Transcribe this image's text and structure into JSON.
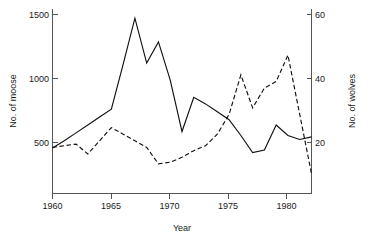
{
  "chart_data": {
    "type": "line",
    "title": "",
    "subtitle": "",
    "xlabel": "Year",
    "ylabel": "No. of moose",
    "y2label": "No. of wolves",
    "xlim": [
      1960,
      1982
    ],
    "ylim": [
      200,
      1600
    ],
    "y2lim": [
      8,
      64
    ],
    "grid": false,
    "legend": "none",
    "x_ticks": [
      1960,
      1965,
      1970,
      1975,
      1980
    ],
    "x_tick_labels": [
      "1960",
      "1965",
      "1970",
      "1975",
      "1980"
    ],
    "y_ticks": [
      500,
      1000,
      1500
    ],
    "y_tick_labels": [
      "500",
      "1000",
      "1500"
    ],
    "y2_ticks": [
      20,
      40,
      60
    ],
    "y2_tick_labels": [
      "20",
      "40",
      "60"
    ],
    "x": [
      1960,
      1961,
      1962,
      1963,
      1964,
      1965,
      1966,
      1967,
      1968,
      1969,
      1970,
      1971,
      1972,
      1973,
      1974,
      1975,
      1976,
      1977,
      1978,
      1979,
      1980,
      1981,
      1982
    ],
    "series": [
      {
        "name": "No. of moose",
        "axis": "left",
        "style": "solid",
        "color": "#111111",
        "values": [
          545,
          600,
          660,
          720,
          780,
          840,
          1180,
          1530,
          1190,
          1350,
          1060,
          670,
          930,
          880,
          820,
          760,
          640,
          510,
          530,
          720,
          640,
          610,
          630
        ]
      },
      {
        "name": "No. of wolves",
        "axis": "right",
        "style": "dashed",
        "color": "#111111",
        "values": [
          22,
          22.5,
          23,
          20,
          24,
          28,
          26,
          24,
          22,
          17,
          17.5,
          19,
          21,
          22.5,
          26,
          32,
          44,
          34,
          40,
          42,
          50,
          32,
          14
        ]
      }
    ],
    "annotations": []
  },
  "axes": {
    "x_title": "Year",
    "y_left_title": "No. of moose",
    "y_right_title": "No. of wolves"
  }
}
